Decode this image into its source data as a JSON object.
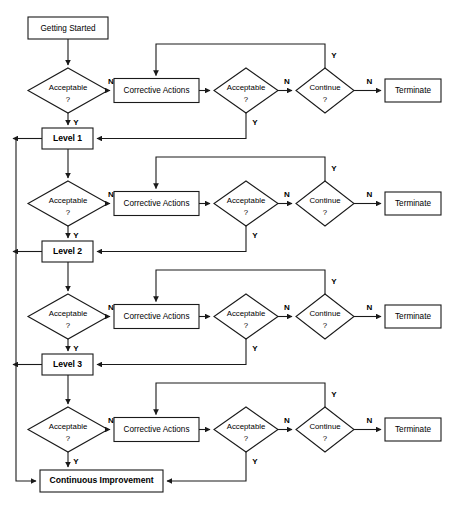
{
  "diagram": {
    "background_color": "#ffffff",
    "line_color": "#1a1a1a",
    "text_color": "#000000",
    "width": 455,
    "height": 511
  },
  "labels": {
    "getting_started": "Getting Started",
    "acceptable": "Acceptable",
    "question_mark": "?",
    "corrective_actions": "Corrective Actions",
    "continue": "Continue",
    "terminate": "Terminate",
    "level_1": "Level 1",
    "level_2": "Level 2",
    "level_3": "Level 3",
    "continuous_improvement": "Continuous Improvement",
    "yes": "Y",
    "no": "N"
  },
  "stages": [
    {
      "id": "stage-1",
      "decision_label": "Acceptable",
      "decision_sub": "?",
      "corrective_label": "Corrective Actions",
      "recheck_label": "Acceptable",
      "recheck_sub": "?",
      "continue_label": "Continue",
      "continue_sub": "?",
      "terminate_label": "Terminate",
      "outcome_label": "Level 1",
      "outcome_bold": true,
      "decision_yes": "Y",
      "decision_no": "N",
      "recheck_yes": "Y",
      "recheck_no": "N",
      "continue_yes": "Y",
      "continue_no": "N"
    },
    {
      "id": "stage-2",
      "decision_label": "Acceptable",
      "decision_sub": "?",
      "corrective_label": "Corrective Actions",
      "recheck_label": "Acceptable",
      "recheck_sub": "?",
      "continue_label": "Continue",
      "continue_sub": "?",
      "terminate_label": "Terminate",
      "outcome_label": "Level 2",
      "outcome_bold": true,
      "decision_yes": "Y",
      "decision_no": "N",
      "recheck_yes": "Y",
      "recheck_no": "N",
      "continue_yes": "Y",
      "continue_no": "N"
    },
    {
      "id": "stage-3",
      "decision_label": "Acceptable",
      "decision_sub": "?",
      "corrective_label": "Corrective Actions",
      "recheck_label": "Acceptable",
      "recheck_sub": "?",
      "continue_label": "Continue",
      "continue_sub": "?",
      "terminate_label": "Terminate",
      "outcome_label": "Level 3",
      "outcome_bold": true,
      "decision_yes": "Y",
      "decision_no": "N",
      "recheck_yes": "Y",
      "recheck_no": "N",
      "continue_yes": "Y",
      "continue_no": "N"
    },
    {
      "id": "stage-4",
      "decision_label": "Acceptable",
      "decision_sub": "?",
      "corrective_label": "Corrective Actions",
      "recheck_label": "Acceptable",
      "recheck_sub": "?",
      "continue_label": "Continue",
      "continue_sub": "?",
      "terminate_label": "Terminate",
      "outcome_label": "Continuous Improvement",
      "outcome_bold": true,
      "decision_yes": "Y",
      "decision_no": "N",
      "recheck_yes": "Y",
      "recheck_no": "N",
      "continue_yes": "Y",
      "continue_no": "N"
    }
  ],
  "start": {
    "label": "Getting Started"
  }
}
